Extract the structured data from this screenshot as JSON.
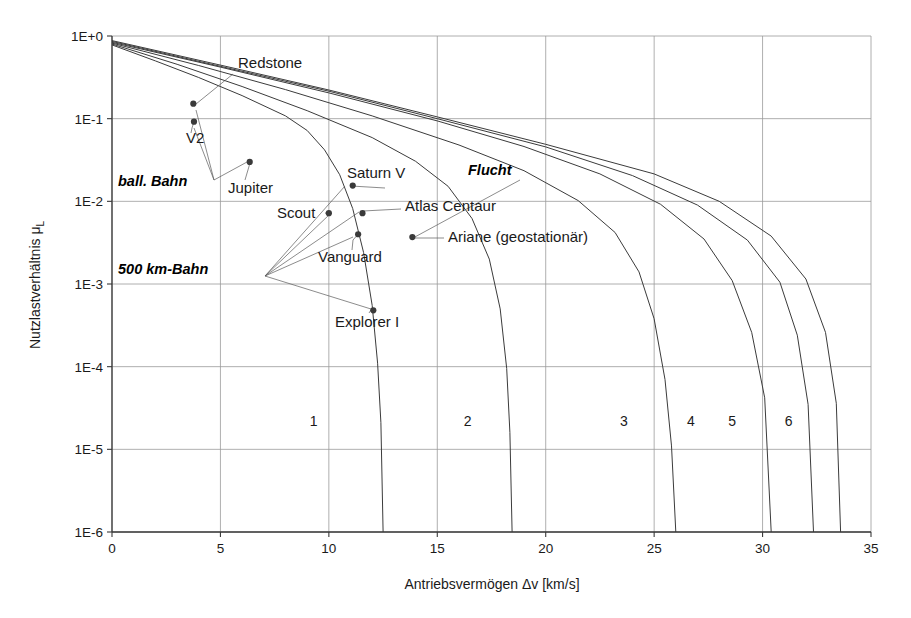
{
  "chart_data": {
    "type": "line",
    "title": "",
    "xlabel": "Antriebsvermögen Δv [km/s]",
    "ylabel": "Nutzlastverhältnis μ",
    "ylabel_sub": "L",
    "xlim": [
      0,
      35
    ],
    "ylim": [
      1e-06,
      1
    ],
    "xticks": [
      "0",
      "5",
      "10",
      "15",
      "20",
      "25",
      "30",
      "35"
    ],
    "xtick_values": [
      0,
      5,
      10,
      15,
      20,
      25,
      30,
      35
    ],
    "yticks": [
      "1E+0",
      "1E-1",
      "1E-2",
      "1E-3",
      "1E-4",
      "1E-5",
      "1E-6"
    ],
    "ytick_values": [
      1,
      0.1,
      0.01,
      0.001,
      0.0001,
      1e-05,
      1e-06
    ],
    "grid": true,
    "legend": "none",
    "series": [
      {
        "name": "1",
        "label_x": 9.3,
        "label_y": 1.9e-05,
        "points": [
          [
            0,
            0.78
          ],
          [
            2,
            0.5
          ],
          [
            4,
            0.315
          ],
          [
            6,
            0.19
          ],
          [
            8,
            0.108
          ],
          [
            9,
            0.072
          ],
          [
            9.8,
            0.042
          ],
          [
            10.5,
            0.021
          ],
          [
            11.1,
            0.0082
          ],
          [
            11.6,
            0.0024
          ],
          [
            12.0,
            0.00055
          ],
          [
            12.25,
            0.00011
          ],
          [
            12.4,
            2.1e-05
          ],
          [
            12.5,
            1e-06
          ]
        ]
      },
      {
        "name": "2",
        "label_x": 16.4,
        "label_y": 1.9e-05,
        "points": [
          [
            0,
            0.8
          ],
          [
            3,
            0.455
          ],
          [
            6,
            0.245
          ],
          [
            9,
            0.125
          ],
          [
            12,
            0.059
          ],
          [
            14,
            0.0305
          ],
          [
            15.5,
            0.0152
          ],
          [
            16.6,
            0.0062
          ],
          [
            17.4,
            0.002
          ],
          [
            17.9,
            0.0005
          ],
          [
            18.2,
            9.5e-05
          ],
          [
            18.35,
            1.6e-05
          ],
          [
            18.45,
            1e-06
          ]
        ]
      },
      {
        "name": "3",
        "label_x": 23.6,
        "label_y": 1.9e-05,
        "points": [
          [
            0,
            0.82
          ],
          [
            4,
            0.44
          ],
          [
            8,
            0.225
          ],
          [
            12,
            0.108
          ],
          [
            16,
            0.048
          ],
          [
            19,
            0.0235
          ],
          [
            21.5,
            0.0102
          ],
          [
            23.2,
            0.0042
          ],
          [
            24.3,
            0.0014
          ],
          [
            25.0,
            0.00038
          ],
          [
            25.5,
            7e-05
          ],
          [
            25.8,
            1.1e-05
          ],
          [
            26.0,
            1e-06
          ]
        ]
      },
      {
        "name": "4",
        "label_x": 26.7,
        "label_y": 1.9e-05,
        "points": [
          [
            0,
            0.84
          ],
          [
            5,
            0.42
          ],
          [
            10,
            0.205
          ],
          [
            15,
            0.094
          ],
          [
            19,
            0.046
          ],
          [
            22.5,
            0.0215
          ],
          [
            25.3,
            0.0092
          ],
          [
            27.3,
            0.0035
          ],
          [
            28.6,
            0.0011
          ],
          [
            29.5,
            0.00026
          ],
          [
            30.1,
            4.2e-05
          ],
          [
            30.4,
            1e-06
          ]
        ]
      },
      {
        "name": "5",
        "label_x": 28.6,
        "label_y": 1.9e-05,
        "points": [
          [
            0,
            0.86
          ],
          [
            5,
            0.43
          ],
          [
            10,
            0.215
          ],
          [
            15,
            0.1
          ],
          [
            20,
            0.0455
          ],
          [
            24,
            0.0205
          ],
          [
            27,
            0.009
          ],
          [
            29.3,
            0.0034
          ],
          [
            30.8,
            0.00105
          ],
          [
            31.6,
            0.00024
          ],
          [
            32.1,
            3.5e-05
          ],
          [
            32.35,
            1e-06
          ]
        ]
      },
      {
        "name": "6",
        "label_x": 31.2,
        "label_y": 1.9e-05,
        "points": [
          [
            0,
            0.88
          ],
          [
            5,
            0.445
          ],
          [
            10,
            0.222
          ],
          [
            15,
            0.105
          ],
          [
            20,
            0.049
          ],
          [
            25,
            0.0215
          ],
          [
            28,
            0.01
          ],
          [
            30.4,
            0.0038
          ],
          [
            32.0,
            0.00115
          ],
          [
            32.9,
            0.00026
          ],
          [
            33.4,
            3.6e-05
          ],
          [
            33.6,
            1e-06
          ]
        ]
      }
    ],
    "points": [
      {
        "label": "Redstone",
        "x": 3.75,
        "y": 0.152,
        "lx": 238,
        "ly": 68,
        "anchor": "start",
        "leader": [
          [
            233,
            74
          ],
          [
            196,
            104
          ]
        ]
      },
      {
        "label": "V2",
        "x": 3.78,
        "y": 0.092,
        "lx": 186,
        "ly": 143,
        "anchor": "start",
        "leader": [
          [
            191,
            133
          ],
          [
            192,
            128
          ]
        ]
      },
      {
        "label": "Jupiter",
        "x": 6.35,
        "y": 0.03,
        "lx": 228,
        "ly": 193,
        "anchor": "start",
        "leader": [
          [
            245,
            180
          ],
          [
            250,
            163
          ]
        ]
      },
      {
        "label": "Saturn V",
        "x": 11.1,
        "y": 0.0155,
        "lx": 347,
        "ly": 178,
        "anchor": "start",
        "leader": [
          [
            385,
            188
          ],
          [
            351,
            186
          ]
        ]
      },
      {
        "label": "Scout",
        "x": 10.0,
        "y": 0.0072,
        "lx": 277,
        "ly": 218,
        "anchor": "start",
        "leader": [
          [
            325,
            213
          ],
          [
            329,
            213
          ]
        ]
      },
      {
        "label": "Atlas Centaur",
        "x": 11.55,
        "y": 0.0072,
        "lx": 405,
        "ly": 211,
        "anchor": "start",
        "leader": [
          [
            401,
            209
          ],
          [
            363,
            211
          ]
        ]
      },
      {
        "label": "Vanguard",
        "x": 11.35,
        "y": 0.004,
        "lx": 318,
        "ly": 262,
        "anchor": "start",
        "leader": [
          [
            352,
            250
          ],
          [
            353,
            240
          ]
        ]
      },
      {
        "label": "Ariane (geostationär)",
        "x": 13.85,
        "y": 0.0037,
        "lx": 448,
        "ly": 242,
        "anchor": "start",
        "leader": [
          [
            444,
            238
          ],
          [
            414,
            238
          ]
        ]
      },
      {
        "label": "Explorer I",
        "x": 12.05,
        "y": 0.00048,
        "lx": 335,
        "ly": 327,
        "anchor": "start",
        "leader": [
          [
            369,
            313
          ],
          [
            371,
            310
          ]
        ]
      }
    ],
    "annotations": [
      {
        "text": "ball. Bahn",
        "x": 118,
        "y": 186,
        "fan": [
          [
            214,
            180
          ],
          [
            196,
            110
          ],
          [
            214,
            180
          ],
          [
            194,
            128
          ],
          [
            214,
            180
          ],
          [
            247,
            162
          ]
        ]
      },
      {
        "text": "500 km-Bahn",
        "x": 118,
        "y": 274,
        "fan": [
          [
            265,
            276
          ],
          [
            330,
            214
          ],
          [
            265,
            276
          ],
          [
            353,
            237
          ],
          [
            265,
            276
          ],
          [
            371,
            309
          ],
          [
            265,
            276
          ],
          [
            345,
            186
          ],
          [
            265,
            276
          ],
          [
            359,
            212
          ]
        ]
      },
      {
        "text": "Flucht",
        "x": 468,
        "y": 175,
        "fan": [
          [
            520,
            180
          ],
          [
            413,
            238
          ]
        ]
      }
    ]
  }
}
